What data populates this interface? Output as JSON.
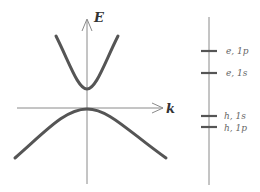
{
  "diagram": {
    "type": "band-structure",
    "axes": {
      "y_label": "E",
      "x_label": "k"
    },
    "bands": [
      {
        "name": "conduction-band",
        "shape": "parabola-up"
      },
      {
        "name": "valence-band",
        "shape": "hyperbola-down"
      }
    ],
    "energy_levels": [
      {
        "label": "e, 1p",
        "carrier": "electron",
        "state": "1p"
      },
      {
        "label": "e, 1s",
        "carrier": "electron",
        "state": "1s"
      },
      {
        "label": "h, 1s",
        "carrier": "hole",
        "state": "1s"
      },
      {
        "label": "h, 1p",
        "carrier": "hole",
        "state": "1p"
      }
    ],
    "colors": {
      "curve": "#555555",
      "axis": "#8a8a8a",
      "label": "#666666",
      "background": "#ffffff"
    }
  }
}
